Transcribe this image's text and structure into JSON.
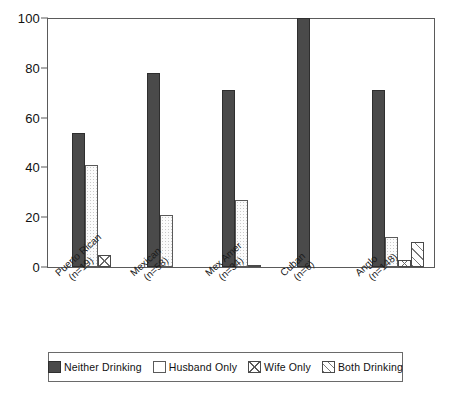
{
  "chart_data": {
    "type": "bar",
    "title": "",
    "subtitle": "",
    "xlabel": "",
    "ylabel": "",
    "ylim": [
      0,
      100
    ],
    "yticks": [
      0,
      20,
      40,
      60,
      80,
      100
    ],
    "ytick_labels": [
      "0",
      "20",
      "40",
      "60",
      "80",
      "100"
    ],
    "grid": false,
    "legend_position": "bottom",
    "grouping": "grouped",
    "categories": [
      "Puerto Rican\n(n=19)",
      "Mexican\n(n=58)",
      "Mex Amer\n(n=34)",
      "Cuban\n(n=6)",
      "Anglo\n(n=148)"
    ],
    "category_lines": [
      {
        "name": "Puerto Rican",
        "n_label": "(n=19)"
      },
      {
        "name": "Mexican",
        "n_label": "(n=58)"
      },
      {
        "name": "Mex Amer",
        "n_label": "(n=34)"
      },
      {
        "name": "Cuban",
        "n_label": "(n=6)"
      },
      {
        "name": "Anglo",
        "n_label": "(n=148)"
      }
    ],
    "series": [
      {
        "name": "Neither Drinking",
        "pattern": "solid-dark",
        "color": "#4a4a4a",
        "values": [
          54,
          78,
          71,
          100,
          71
        ]
      },
      {
        "name": "Husband Only",
        "pattern": "open-white",
        "color": "#ffffff",
        "values": [
          41,
          21,
          27,
          0,
          12
        ]
      },
      {
        "name": "Wife Only",
        "pattern": "crosshatch",
        "color": "#ffffff",
        "values": [
          5,
          0,
          1,
          0,
          3
        ]
      },
      {
        "name": "Both Drinking",
        "pattern": "diagonal",
        "color": "#ffffff",
        "values": [
          0,
          0,
          0,
          0,
          10
        ]
      }
    ]
  },
  "legend": {
    "items": [
      {
        "label": "Neither Drinking",
        "swatch": "legend-swatch-neither-drinking"
      },
      {
        "label": "Husband Only",
        "swatch": "legend-swatch-husband-only"
      },
      {
        "label": "Wife Only",
        "swatch": "legend-swatch-wife-only"
      },
      {
        "label": "Both Drinking",
        "swatch": "legend-swatch-both-drinking"
      }
    ]
  },
  "axis": {
    "y_ticks": [
      "0",
      "20",
      "40",
      "60",
      "80",
      "100"
    ]
  }
}
